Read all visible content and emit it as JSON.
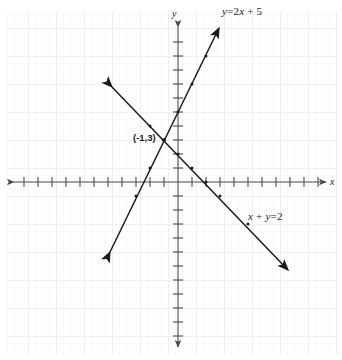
{
  "figure": {
    "kind": "coordinate-plane-line-graph",
    "background_color": "#ffffff",
    "grid_color": "#e9e9ef",
    "axis_color": "#4a4a4a",
    "line_color": "#1b1b1b",
    "text_color": "#1b1b1b"
  },
  "axes": {
    "x_label": "x",
    "y_label": "y",
    "origin_px": {
      "x": 178,
      "y": 182
    },
    "tick_spacing_px": 14,
    "x_range": [
      -12,
      11
    ],
    "y_range": [
      -11,
      11
    ],
    "ticks_visible": true,
    "tick_numbers_visible": false,
    "arrows": "both-ends"
  },
  "lines": [
    {
      "id": "line-a",
      "label": "y = 2x + 5",
      "label_parts": {
        "lhs_var": "y",
        "eq": "=",
        "coef": "2",
        "x_var": "x",
        "plus": "+",
        "const": "5"
      },
      "slope": 2,
      "intercept": 5,
      "label_position_px": {
        "x": 222,
        "y": 6
      },
      "endpoints_px": [
        {
          "x": 110,
          "y": 252
        },
        {
          "x": 219,
          "y": 28
        }
      ]
    },
    {
      "id": "line-b",
      "label": "x + y = 2",
      "label_parts": {
        "x_var": "x",
        "plus": "+",
        "y_var": "y",
        "eq": "=",
        "const": "2"
      },
      "slope": -1,
      "intercept": 2,
      "label_position_px": {
        "x": 248,
        "y": 211
      },
      "endpoints_px": [
        {
          "x": 112,
          "y": 87
        },
        {
          "x": 288,
          "y": 270
        }
      ]
    }
  ],
  "points": [
    {
      "id": "intersection",
      "label": "(-1,3)",
      "coords": {
        "x": -1,
        "y": 3
      },
      "label_position_px": {
        "x": 133,
        "y": 132
      }
    }
  ]
}
